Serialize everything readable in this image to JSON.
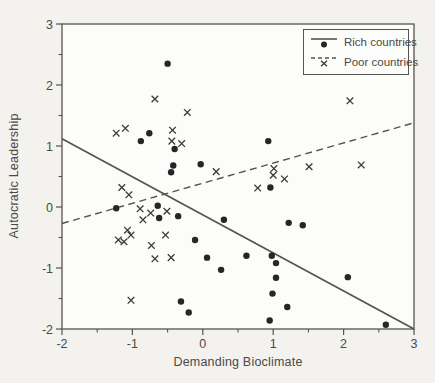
{
  "figure": {
    "page_bg_color": "#f3f2ef",
    "plot_bg_color": "#fcfcfa",
    "frame_color": "#55544f",
    "text_color": "#4a4945",
    "point_color": "#262626",
    "xmark_color": "#3c3b38"
  },
  "chart_data": {
    "type": "scatter",
    "title": "",
    "xlabel": "Demanding Bioclimate",
    "ylabel": "Autocratic Leadership",
    "xlim": [
      -2,
      3
    ],
    "ylim": [
      -2,
      3
    ],
    "x_ticks": [
      -2,
      -1,
      0,
      1,
      2,
      3
    ],
    "y_ticks": [
      3,
      2,
      1,
      0,
      -1,
      -2
    ],
    "minor_tick_interval": 0.5,
    "grid": false,
    "legend_position": "top-right",
    "series": [
      {
        "name": "Rich countries",
        "marker": "filled-circle",
        "trend_line_style": "solid",
        "trend_line": {
          "x1": -2,
          "y1": 1.12,
          "x2": 3,
          "y2": -2.0
        },
        "points": [
          [
            -0.5,
            2.35
          ],
          [
            -0.88,
            1.08
          ],
          [
            -0.76,
            1.21
          ],
          [
            -0.4,
            0.95
          ],
          [
            -0.42,
            0.68
          ],
          [
            -0.45,
            0.57
          ],
          [
            -0.03,
            0.7
          ],
          [
            0.93,
            1.08
          ],
          [
            0.96,
            0.32
          ],
          [
            -1.23,
            -0.02
          ],
          [
            -0.64,
            0.02
          ],
          [
            -0.62,
            -0.18
          ],
          [
            -0.35,
            -0.15
          ],
          [
            0.3,
            -0.21
          ],
          [
            1.22,
            -0.26
          ],
          [
            1.42,
            -0.3
          ],
          [
            -0.11,
            -0.54
          ],
          [
            0.06,
            -0.83
          ],
          [
            0.26,
            -1.03
          ],
          [
            0.62,
            -0.8
          ],
          [
            0.98,
            -0.8
          ],
          [
            1.04,
            -0.92
          ],
          [
            1.04,
            -1.16
          ],
          [
            2.06,
            -1.15
          ],
          [
            0.99,
            -1.42
          ],
          [
            1.2,
            -1.64
          ],
          [
            0.95,
            -1.86
          ],
          [
            2.6,
            -1.93
          ],
          [
            -0.31,
            -1.55
          ],
          [
            -0.2,
            -1.73
          ]
        ]
      },
      {
        "name": "Poor countries",
        "marker": "x",
        "trend_line_style": "dashed",
        "trend_line": {
          "x1": -2,
          "y1": -0.27,
          "x2": 3,
          "y2": 1.38
        },
        "points": [
          [
            -0.68,
            1.77
          ],
          [
            -0.22,
            1.55
          ],
          [
            -1.23,
            1.21
          ],
          [
            -1.1,
            1.29
          ],
          [
            -0.43,
            1.26
          ],
          [
            -0.44,
            1.08
          ],
          [
            -0.3,
            1.04
          ],
          [
            2.09,
            1.74
          ],
          [
            0.19,
            0.58
          ],
          [
            1.01,
            0.63
          ],
          [
            1.0,
            0.52
          ],
          [
            1.16,
            0.46
          ],
          [
            1.51,
            0.66
          ],
          [
            2.25,
            0.69
          ],
          [
            0.78,
            0.31
          ],
          [
            -1.15,
            0.32
          ],
          [
            -1.05,
            0.2
          ],
          [
            -0.89,
            -0.03
          ],
          [
            -0.74,
            -0.1
          ],
          [
            -0.51,
            -0.07
          ],
          [
            -0.85,
            -0.21
          ],
          [
            -1.07,
            -0.38
          ],
          [
            -1.02,
            -0.46
          ],
          [
            -1.2,
            -0.54
          ],
          [
            -1.12,
            -0.57
          ],
          [
            -0.53,
            -0.46
          ],
          [
            -0.73,
            -0.63
          ],
          [
            -0.68,
            -0.85
          ],
          [
            -0.45,
            -0.83
          ],
          [
            -1.02,
            -1.53
          ]
        ]
      }
    ]
  }
}
